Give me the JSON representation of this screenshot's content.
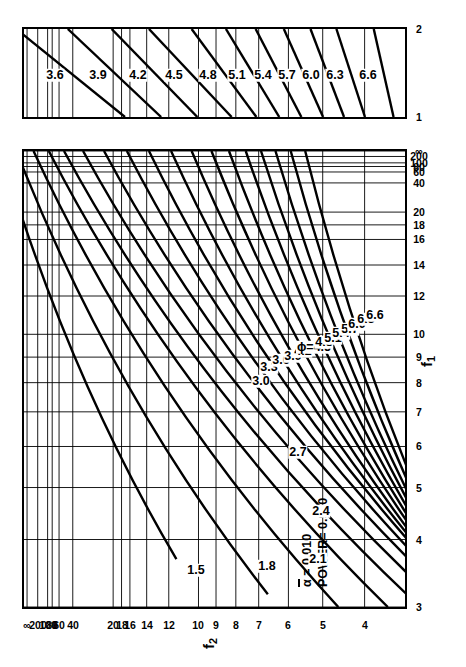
{
  "figure": {
    "type": "power-function-chart",
    "annotations": {
      "alpha_label": "α",
      "alpha_value": "= 0.010",
      "power_label": "POWER=",
      "power_value": "0.990"
    },
    "axes": {
      "x_title": "f",
      "x_title_sub": "1",
      "y_title": "f",
      "y_title_sub": "2",
      "x_ticks_main": [
        "3",
        "4",
        "5",
        "6",
        "7",
        "8",
        "9",
        "10",
        "12",
        "14",
        "16",
        "18",
        "20",
        "40",
        "60",
        "80",
        "100",
        "200",
        "∞"
      ],
      "x_ticks_lower": [
        "1",
        "2"
      ],
      "y_ticks": [
        "4",
        "5",
        "6",
        "7",
        "8",
        "9",
        "10",
        "12",
        "14",
        "16",
        "18",
        "20",
        "40",
        "60",
        "80",
        "100",
        "200",
        "∞"
      ]
    },
    "phi_prefix": "ϕ=",
    "phi_marked": "4.5",
    "curve_labels_main": [
      "1.5",
      "1.8",
      "2.1",
      "2.4",
      "2.7",
      "3.0",
      "3.3",
      "3.6",
      "3.9",
      "4.2",
      "4.5",
      "4.8",
      "5.1",
      "5.4",
      "5.7",
      "6.0",
      "6.3",
      "6.6"
    ],
    "curve_labels_lower": [
      "3.6",
      "3.9",
      "4.2",
      "4.5",
      "4.8",
      "5.1",
      "5.4",
      "5.7",
      "6.0",
      "6.3",
      "6.6"
    ]
  },
  "chart_data": {
    "type": "line",
    "xlabel": "f1",
    "ylabel": "f2",
    "alpha": 0.01,
    "power": 0.99,
    "grid": true,
    "legend": "none",
    "x_axis": {
      "name": "f1 (numerator degrees of freedom)",
      "scale": "nonlinear",
      "ticks": [
        3,
        4,
        5,
        6,
        7,
        8,
        9,
        10,
        12,
        14,
        16,
        18,
        20,
        40,
        60,
        80,
        100,
        200,
        "∞"
      ],
      "tick_labels": [
        "3",
        "4",
        "5",
        "6",
        "7",
        "8",
        "9",
        "10",
        "12",
        "14",
        "16",
        "18",
        "20",
        "40",
        "60",
        "80",
        "100",
        "200",
        "∞"
      ],
      "positions": [
        0.0,
        0.148,
        0.262,
        0.352,
        0.428,
        0.492,
        0.548,
        0.598,
        0.682,
        0.75,
        0.806,
        0.838,
        0.866,
        0.93,
        0.954,
        0.966,
        0.974,
        0.988,
        1.0
      ]
    },
    "x_axis_lower_panel": {
      "name": "f1 (continued)",
      "ticks": [
        1,
        2
      ],
      "tick_labels": [
        "1",
        "2"
      ],
      "positions": [
        0.0,
        1.0
      ]
    },
    "y_axis": {
      "name": "f2 (denominator degrees of freedom)",
      "scale": "nonlinear",
      "ticks": [
        4,
        5,
        6,
        7,
        8,
        9,
        10,
        12,
        14,
        16,
        18,
        20,
        40,
        60,
        80,
        100,
        200,
        "∞"
      ],
      "tick_labels": [
        "4",
        "5",
        "6",
        "7",
        "8",
        "9",
        "10",
        "12",
        "14",
        "16",
        "18",
        "20",
        "40",
        "60",
        "80",
        "100",
        "200",
        "∞"
      ],
      "positions": [
        0.106,
        0.216,
        0.306,
        0.384,
        0.444,
        0.496,
        0.542,
        0.62,
        0.678,
        0.722,
        0.744,
        0.766,
        0.872,
        0.908,
        0.926,
        0.938,
        0.964,
        0.992
      ]
    },
    "series": [
      {
        "name": "ϕ = 1.5",
        "phi": 1.5,
        "panel": "main",
        "x_start": 0.105,
        "x_end": 1.0,
        "y_start": 0.6,
        "y_end": 1.06
      },
      {
        "name": "ϕ = 1.8",
        "phi": 1.8,
        "panel": "main",
        "x_start": 0.028,
        "x_end": 1.0,
        "y_start": 0.36,
        "y_end": 1.02
      },
      {
        "name": "ϕ = 2.1",
        "phi": 2.1,
        "panel": "main",
        "x_start": 0.0,
        "x_end": 1.0,
        "y_start": 0.175,
        "y_end": 0.975
      },
      {
        "name": "ϕ = 2.4",
        "phi": 2.4,
        "panel": "main",
        "x_start": 0.0,
        "x_end": 1.0,
        "y_start": 0.045,
        "y_end": 0.935
      },
      {
        "name": "ϕ = 2.7",
        "phi": 2.7,
        "panel": "main",
        "x_start": 0.0,
        "x_end": 1.0,
        "y_start": -0.04,
        "y_end": 0.895
      },
      {
        "name": "ϕ = 3.0",
        "phi": 3.0,
        "panel": "main",
        "x_start": 0.0,
        "x_end": 1.0,
        "y_start": -0.1,
        "y_end": 0.845
      },
      {
        "name": "ϕ = 3.3",
        "phi": 3.3,
        "panel": "main",
        "x_start": 0.0,
        "x_end": 1.0,
        "y_start": -0.14,
        "y_end": 0.79
      },
      {
        "name": "ϕ = 3.6",
        "phi": 3.6,
        "panel": "main",
        "x_start": 0.0,
        "x_end": 1.0,
        "y_start": -0.16,
        "y_end": 0.73
      },
      {
        "name": "ϕ = 3.9",
        "phi": 3.9,
        "panel": "main",
        "x_start": 0.0,
        "x_end": 1.0,
        "y_start": -0.17,
        "y_end": 0.672
      },
      {
        "name": "ϕ = 4.2",
        "phi": 4.2,
        "panel": "main",
        "x_start": 0.0,
        "x_end": 1.0,
        "y_start": -0.17,
        "y_end": 0.614
      },
      {
        "name": "ϕ = 4.5",
        "phi": 4.5,
        "panel": "main",
        "x_start": 0.0,
        "x_end": 1.0,
        "y_start": -0.17,
        "y_end": 0.56
      },
      {
        "name": "ϕ = 4.8",
        "phi": 4.8,
        "panel": "main",
        "x_start": 0.0,
        "x_end": 1.0,
        "y_start": -0.17,
        "y_end": 0.508
      },
      {
        "name": "ϕ = 5.1",
        "phi": 5.1,
        "panel": "main",
        "x_start": 0.0,
        "x_end": 1.0,
        "y_start": -0.17,
        "y_end": 0.462
      },
      {
        "name": "ϕ = 5.4",
        "phi": 5.4,
        "panel": "main",
        "x_start": 0.0,
        "x_end": 1.0,
        "y_start": -0.17,
        "y_end": 0.418
      },
      {
        "name": "ϕ = 5.7",
        "phi": 5.7,
        "panel": "main",
        "x_start": 0.0,
        "x_end": 1.0,
        "y_start": -0.17,
        "y_end": 0.378
      },
      {
        "name": "ϕ = 6.0",
        "phi": 6.0,
        "panel": "main",
        "x_start": 0.0,
        "x_end": 1.0,
        "y_start": -0.17,
        "y_end": 0.34
      },
      {
        "name": "ϕ = 6.3",
        "phi": 6.3,
        "panel": "main",
        "x_start": 0.0,
        "x_end": 1.0,
        "y_start": -0.17,
        "y_end": 0.3
      },
      {
        "name": "ϕ = 6.6",
        "phi": 6.6,
        "panel": "main",
        "x_start": 0.0,
        "x_end": 1.0,
        "y_start": -0.17,
        "y_end": 0.262
      }
    ],
    "series_lower_panel": [
      {
        "name": "ϕ = 3.6",
        "phi": 3.6,
        "y_start": 0.735,
        "y_end": 1.02
      },
      {
        "name": "ϕ = 3.9",
        "phi": 3.9,
        "y_start": 0.64,
        "y_end": 0.885
      },
      {
        "name": "ϕ = 4.2",
        "phi": 4.2,
        "y_start": 0.545,
        "y_end": 0.77
      },
      {
        "name": "ϕ = 4.5",
        "phi": 4.5,
        "y_start": 0.455,
        "y_end": 0.672
      },
      {
        "name": "ϕ = 4.8",
        "phi": 4.8,
        "y_start": 0.39,
        "y_end": 0.56
      },
      {
        "name": "ϕ = 5.1",
        "phi": 5.1,
        "y_start": 0.33,
        "y_end": 0.47
      },
      {
        "name": "ϕ = 5.4",
        "phi": 5.4,
        "y_start": 0.272,
        "y_end": 0.392
      },
      {
        "name": "ϕ = 5.7",
        "phi": 5.7,
        "y_start": 0.215,
        "y_end": 0.318
      },
      {
        "name": "ϕ = 6.0",
        "phi": 6.0,
        "y_start": 0.16,
        "y_end": 0.248
      },
      {
        "name": "ϕ = 6.3",
        "phi": 6.3,
        "y_start": 0.105,
        "y_end": 0.18
      },
      {
        "name": "ϕ = 6.6",
        "phi": 6.6,
        "y_start": 0.03,
        "y_end": 0.082
      }
    ]
  }
}
